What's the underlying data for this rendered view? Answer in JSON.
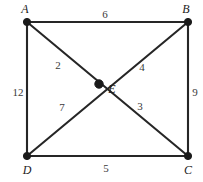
{
  "figure": {
    "kind": "weighted-graph-diagram",
    "background_color": "#ffffff",
    "edge_color": "#262626",
    "vertex_color": "#1a1a1a",
    "label_color": "#1c1c1c",
    "weight_color": "#3a3a3a",
    "width": 203,
    "height": 182
  },
  "vertices": [
    {
      "id": "A",
      "label": "A",
      "x": 27,
      "y": 22,
      "label_x": 25,
      "label_y": 9
    },
    {
      "id": "B",
      "label": "B",
      "x": 188,
      "y": 22,
      "label_x": 186,
      "label_y": 9
    },
    {
      "id": "C",
      "label": "C",
      "x": 188,
      "y": 156,
      "label_x": 188,
      "label_y": 170
    },
    {
      "id": "D",
      "label": "D",
      "x": 27,
      "y": 156,
      "label_x": 27,
      "label_y": 170
    },
    {
      "id": "E",
      "label": "E",
      "x": 99,
      "y": 84,
      "label_x": 112,
      "label_y": 89
    }
  ],
  "edges": [
    {
      "from": "A",
      "to": "B",
      "weight": "6",
      "label_x": 105,
      "label_y": 14
    },
    {
      "from": "A",
      "to": "D",
      "weight": "12",
      "label_x": 18,
      "label_y": 92
    },
    {
      "from": "B",
      "to": "C",
      "weight": "9",
      "label_x": 195,
      "label_y": 92
    },
    {
      "from": "D",
      "to": "C",
      "weight": "5",
      "label_x": 106,
      "label_y": 168
    },
    {
      "from": "A",
      "to": "E",
      "weight": "2",
      "label_x": 58,
      "label_y": 65
    },
    {
      "from": "B",
      "to": "E",
      "weight": "4",
      "label_x": 142,
      "label_y": 67
    },
    {
      "from": "D",
      "to": "E",
      "weight": "7",
      "label_x": 62,
      "label_y": 107
    },
    {
      "from": "C",
      "to": "E",
      "weight": "3",
      "label_x": 140,
      "label_y": 106
    }
  ],
  "long_edges": [
    {
      "from": "A",
      "to": "C"
    },
    {
      "from": "B",
      "to": "D"
    }
  ]
}
